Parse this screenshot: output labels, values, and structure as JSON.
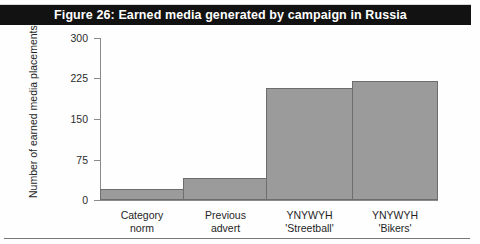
{
  "figure": {
    "title": "Figure 26: Earned media generated by campaign in Russia",
    "title_bar_color": "#121212",
    "title_text_color": "#ffffff",
    "bar_fill_color": "#9b9b9b",
    "bar_stroke_color": "#6d6d6d",
    "axis_color": "#8a8a8a"
  },
  "chart_data": {
    "type": "bar",
    "title": "Figure 26: Earned media generated by campaign in Russia",
    "xlabel": "",
    "ylabel": "Number of earned media placements",
    "categories": [
      "Category norm",
      "Previous advert",
      "YNYWYH 'Streetball'",
      "YNYWYH 'Bikers'"
    ],
    "category_lines": [
      [
        "Category",
        "norm"
      ],
      [
        "Previous",
        "advert"
      ],
      [
        "YNYWYH",
        "'Streetball'"
      ],
      [
        "YNYWYH",
        "'Bikers'"
      ]
    ],
    "values": [
      20,
      40,
      207,
      220
    ],
    "ylim": [
      0,
      300
    ],
    "yticks": [
      0,
      75,
      150,
      225,
      300
    ],
    "ytick_labels": [
      "0",
      "75",
      "150",
      "225",
      "300"
    ],
    "grid": false,
    "legend": null
  }
}
